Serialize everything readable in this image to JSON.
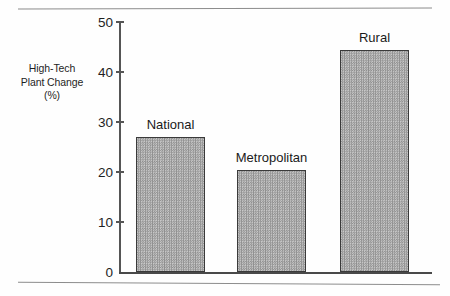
{
  "chart_data": {
    "type": "bar",
    "title": "",
    "subtitle": "",
    "xlabel": "",
    "ylabel": "High-Tech Plant Change (%)",
    "ylabel_lines": [
      "High-Tech",
      "Plant Change",
      "(%)"
    ],
    "categories": [
      "National",
      "Metropolitan",
      "Rural"
    ],
    "values": [
      27,
      20.5,
      44.5
    ],
    "ylim": [
      0,
      50
    ],
    "yticks": [
      0,
      10,
      20,
      30,
      40,
      50
    ],
    "ytick_labels": [
      "0",
      "10",
      "20",
      "30",
      "40",
      "50"
    ],
    "grid": false,
    "legend": "none",
    "data_labels": "above-bar",
    "bars": [
      {
        "label": "National",
        "value": 27
      },
      {
        "label": "Metropolitan",
        "value": 20.5
      },
      {
        "label": "Rural",
        "value": 44.5
      }
    ],
    "colors": {
      "bar_fill": "#a8a8a8",
      "bar_edge": "#3a3a3a",
      "axis": "#4f4f4f",
      "text": "#1c1c1c",
      "background": "#ffffff"
    }
  }
}
